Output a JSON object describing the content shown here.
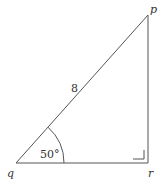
{
  "diagram": {
    "type": "right-triangle",
    "vertices": {
      "p": {
        "label": "p"
      },
      "q": {
        "label": "q"
      },
      "r": {
        "label": "r"
      }
    },
    "hypotenuse_length": "8",
    "angle_q": "50°",
    "right_angle_at": "r",
    "stroke_color": "#555555"
  }
}
